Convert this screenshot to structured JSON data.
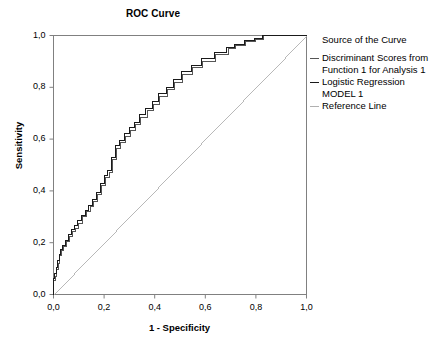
{
  "chart_data": {
    "type": "line",
    "title": "ROC Curve",
    "xlabel": "1 - Specificity",
    "ylabel": "Sensitivity",
    "xlim": [
      0,
      1
    ],
    "ylim": [
      0,
      1
    ],
    "grid": false,
    "legend_position": "right",
    "legend_title": "Source of the Curve",
    "xticks": [
      "0,0",
      "0,2",
      "0,4",
      "0,6",
      "0,8",
      "1,0"
    ],
    "xtick_values": [
      0,
      0.2,
      0.4,
      0.6,
      0.8,
      1
    ],
    "yticks": [
      "0,0",
      "0,2",
      "0,4",
      "0,6",
      "0,8",
      "1,0"
    ],
    "ytick_values": [
      0,
      0.2,
      0.4,
      0.6,
      0.8,
      1
    ],
    "decimal_separator": ",",
    "series": [
      {
        "name": "Discriminant Scores from Function 1 for Analysis 1",
        "color": "#555555",
        "style": "step",
        "x": [
          0,
          0,
          0.006,
          0.006,
          0.012,
          0.012,
          0.018,
          0.018,
          0.024,
          0.024,
          0.03,
          0.03,
          0.04,
          0.04,
          0.05,
          0.05,
          0.062,
          0.062,
          0.075,
          0.075,
          0.088,
          0.088,
          0.1,
          0.1,
          0.115,
          0.115,
          0.13,
          0.13,
          0.145,
          0.145,
          0.16,
          0.16,
          0.175,
          0.175,
          0.19,
          0.19,
          0.205,
          0.205,
          0.22,
          0.22,
          0.235,
          0.235,
          0.25,
          0.25,
          0.265,
          0.265,
          0.285,
          0.285,
          0.305,
          0.305,
          0.325,
          0.325,
          0.345,
          0.345,
          0.37,
          0.37,
          0.395,
          0.395,
          0.42,
          0.42,
          0.45,
          0.45,
          0.48,
          0.48,
          0.51,
          0.51,
          0.55,
          0.55,
          0.59,
          0.59,
          0.64,
          0.64,
          0.69,
          0.69,
          0.72,
          0.72,
          0.76,
          0.76,
          0.8,
          0.8,
          0.83,
          0.83,
          1.0
        ],
        "y": [
          0,
          0.055,
          0.055,
          0.07,
          0.07,
          0.095,
          0.095,
          0.12,
          0.12,
          0.15,
          0.15,
          0.17,
          0.17,
          0.185,
          0.185,
          0.205,
          0.205,
          0.225,
          0.225,
          0.245,
          0.245,
          0.255,
          0.255,
          0.275,
          0.275,
          0.3,
          0.3,
          0.32,
          0.32,
          0.34,
          0.34,
          0.36,
          0.36,
          0.385,
          0.385,
          0.42,
          0.42,
          0.45,
          0.45,
          0.47,
          0.47,
          0.52,
          0.52,
          0.565,
          0.565,
          0.585,
          0.585,
          0.61,
          0.61,
          0.635,
          0.635,
          0.655,
          0.655,
          0.685,
          0.685,
          0.71,
          0.71,
          0.735,
          0.735,
          0.765,
          0.765,
          0.79,
          0.79,
          0.82,
          0.82,
          0.85,
          0.85,
          0.875,
          0.875,
          0.9,
          0.9,
          0.925,
          0.925,
          0.95,
          0.95,
          0.96,
          0.96,
          0.975,
          0.975,
          0.985,
          0.985,
          1.0,
          1.0
        ]
      },
      {
        "name": "Logistic Regression MODEL 1",
        "color": "#1a1a1a",
        "style": "step",
        "x": [
          0,
          0,
          0.004,
          0.004,
          0.01,
          0.01,
          0.016,
          0.016,
          0.022,
          0.022,
          0.028,
          0.028,
          0.036,
          0.036,
          0.046,
          0.046,
          0.058,
          0.058,
          0.07,
          0.07,
          0.082,
          0.082,
          0.095,
          0.095,
          0.11,
          0.11,
          0.125,
          0.125,
          0.14,
          0.14,
          0.155,
          0.155,
          0.17,
          0.17,
          0.185,
          0.185,
          0.2,
          0.2,
          0.215,
          0.215,
          0.23,
          0.23,
          0.245,
          0.245,
          0.262,
          0.262,
          0.28,
          0.28,
          0.3,
          0.3,
          0.32,
          0.32,
          0.34,
          0.34,
          0.365,
          0.365,
          0.39,
          0.39,
          0.415,
          0.415,
          0.445,
          0.445,
          0.475,
          0.475,
          0.505,
          0.505,
          0.545,
          0.545,
          0.585,
          0.585,
          0.635,
          0.635,
          0.685,
          0.685,
          0.715,
          0.715,
          0.755,
          0.755,
          0.795,
          0.795,
          0.825,
          0.825,
          1.0
        ],
        "y": [
          0,
          0.06,
          0.06,
          0.08,
          0.08,
          0.105,
          0.105,
          0.13,
          0.13,
          0.155,
          0.155,
          0.175,
          0.175,
          0.19,
          0.19,
          0.21,
          0.21,
          0.23,
          0.23,
          0.25,
          0.25,
          0.265,
          0.265,
          0.285,
          0.285,
          0.305,
          0.305,
          0.325,
          0.325,
          0.345,
          0.345,
          0.365,
          0.365,
          0.395,
          0.395,
          0.43,
          0.43,
          0.46,
          0.46,
          0.48,
          0.48,
          0.53,
          0.53,
          0.575,
          0.575,
          0.595,
          0.595,
          0.62,
          0.62,
          0.645,
          0.645,
          0.665,
          0.665,
          0.695,
          0.695,
          0.72,
          0.72,
          0.745,
          0.745,
          0.775,
          0.775,
          0.8,
          0.8,
          0.83,
          0.83,
          0.86,
          0.86,
          0.885,
          0.885,
          0.91,
          0.91,
          0.935,
          0.935,
          0.955,
          0.955,
          0.965,
          0.965,
          0.98,
          0.98,
          0.99,
          0.99,
          1.0,
          1.0
        ]
      },
      {
        "name": "Reference Line",
        "color": "#b0b0b0",
        "style": "diagonal",
        "x": [
          0,
          1
        ],
        "y": [
          0,
          1
        ]
      }
    ]
  },
  "legend": {
    "title": "Source of the Curve",
    "entries": [
      {
        "label": "Discriminant Scores from\nFunction 1 for Analysis 1"
      },
      {
        "label": "Logistic Regression\nMODEL 1"
      },
      {
        "label": "Reference Line"
      }
    ]
  },
  "axes": {
    "frame_color": "#808080",
    "tick_color": "#808080"
  }
}
